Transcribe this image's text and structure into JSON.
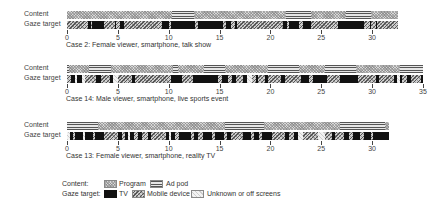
{
  "chart_data": {
    "type": "timeline",
    "title": "",
    "xlabel": "",
    "ylabel": "",
    "xlim": [
      0,
      35
    ],
    "px_per_unit": 10.17,
    "row_labels": {
      "content": "Content",
      "gaze": "Gaze target"
    },
    "cases": [
      {
        "caption": "Case 2: Female viewer, smartphone, talk show",
        "end": 32.5,
        "ticks": [
          0,
          5,
          10,
          15,
          20,
          25,
          30
        ],
        "content": [
          {
            "type": "program",
            "start": 0,
            "end": 10.3
          },
          {
            "type": "ad",
            "start": 10.3,
            "end": 12.5
          },
          {
            "type": "program",
            "start": 12.5,
            "end": 21.5
          },
          {
            "type": "ad",
            "start": 21.5,
            "end": 24.0
          },
          {
            "type": "program",
            "start": 24.0,
            "end": 27.4
          },
          {
            "type": "ad",
            "start": 27.4,
            "end": 29.9
          },
          {
            "type": "program",
            "start": 29.9,
            "end": 32.5
          }
        ],
        "gaze": [
          {
            "type": "mobile",
            "start": 0,
            "end": 2.1
          },
          {
            "type": "tv",
            "start": 2.1,
            "end": 2.4
          },
          {
            "type": "mobile",
            "start": 2.4,
            "end": 2.5
          },
          {
            "type": "tv",
            "start": 2.5,
            "end": 3.6
          },
          {
            "type": "mobile",
            "start": 3.6,
            "end": 4.7
          },
          {
            "type": "tv",
            "start": 4.7,
            "end": 4.8
          },
          {
            "type": "mobile",
            "start": 4.8,
            "end": 5.2
          },
          {
            "type": "tv",
            "start": 5.2,
            "end": 5.6
          },
          {
            "type": "mobile",
            "start": 5.6,
            "end": 9.3
          },
          {
            "type": "tv",
            "start": 9.3,
            "end": 10.0
          },
          {
            "type": "mobile",
            "start": 10.0,
            "end": 10.2
          },
          {
            "type": "tv",
            "start": 10.2,
            "end": 12.6
          },
          {
            "type": "mobile",
            "start": 12.6,
            "end": 12.9
          },
          {
            "type": "tv",
            "start": 12.9,
            "end": 15.3
          },
          {
            "type": "mobile",
            "start": 15.3,
            "end": 15.6
          },
          {
            "type": "tv",
            "start": 15.6,
            "end": 16.1
          },
          {
            "type": "mobile",
            "start": 16.1,
            "end": 16.5
          },
          {
            "type": "tv",
            "start": 16.5,
            "end": 16.7
          },
          {
            "type": "mobile",
            "start": 16.7,
            "end": 21.2
          },
          {
            "type": "tv",
            "start": 21.2,
            "end": 21.6
          },
          {
            "type": "mobile",
            "start": 21.6,
            "end": 21.8
          },
          {
            "type": "tv",
            "start": 21.8,
            "end": 22.8
          },
          {
            "type": "mobile",
            "start": 22.8,
            "end": 23.2
          },
          {
            "type": "tv",
            "start": 23.2,
            "end": 24.0
          },
          {
            "type": "mobile",
            "start": 24.0,
            "end": 26.6
          },
          {
            "type": "tv",
            "start": 26.6,
            "end": 29.2
          },
          {
            "type": "mobile",
            "start": 29.2,
            "end": 29.8
          },
          {
            "type": "tv",
            "start": 29.8,
            "end": 29.9
          },
          {
            "type": "mobile",
            "start": 29.9,
            "end": 30.4
          },
          {
            "type": "tv",
            "start": 30.4,
            "end": 30.5
          },
          {
            "type": "mobile",
            "start": 30.5,
            "end": 32.5
          }
        ]
      },
      {
        "caption": "Case 14: Male viewer, smartphone, live sports event",
        "end": 35,
        "ticks": [
          0,
          5,
          10,
          15,
          20,
          25,
          30,
          35
        ],
        "content": [
          {
            "type": "ad",
            "start": 0,
            "end": 0.2
          },
          {
            "type": "program",
            "start": 0.2,
            "end": 2.2
          },
          {
            "type": "ad",
            "start": 2.2,
            "end": 4.3
          },
          {
            "type": "program",
            "start": 4.3,
            "end": 10.4
          },
          {
            "type": "ad",
            "start": 10.4,
            "end": 10.9
          },
          {
            "type": "program",
            "start": 10.9,
            "end": 13.5
          },
          {
            "type": "ad",
            "start": 13.5,
            "end": 15.5
          },
          {
            "type": "program",
            "start": 15.5,
            "end": 19.8
          },
          {
            "type": "ad",
            "start": 19.8,
            "end": 22.8
          },
          {
            "type": "program",
            "start": 22.8,
            "end": 25.4
          },
          {
            "type": "ad",
            "start": 25.4,
            "end": 28.4
          },
          {
            "type": "program",
            "start": 28.4,
            "end": 32.7
          },
          {
            "type": "ad",
            "start": 32.7,
            "end": 35
          }
        ],
        "gaze": [
          {
            "type": "mobile",
            "start": 0,
            "end": 0.4
          },
          {
            "type": "tv",
            "start": 0.4,
            "end": 0.8
          },
          {
            "type": "unknown",
            "start": 0.8,
            "end": 1.0
          },
          {
            "type": "tv",
            "start": 1.0,
            "end": 1.5
          },
          {
            "type": "unknown",
            "start": 1.5,
            "end": 1.8
          },
          {
            "type": "mobile",
            "start": 1.8,
            "end": 2.9
          },
          {
            "type": "tv",
            "start": 2.9,
            "end": 3.3
          },
          {
            "type": "mobile",
            "start": 3.3,
            "end": 4.2
          },
          {
            "type": "tv",
            "start": 4.2,
            "end": 4.5
          },
          {
            "type": "unknown",
            "start": 4.5,
            "end": 5.0
          },
          {
            "type": "mobile",
            "start": 5.0,
            "end": 6.4
          },
          {
            "type": "tv",
            "start": 6.4,
            "end": 6.7
          },
          {
            "type": "mobile",
            "start": 6.7,
            "end": 10.2
          },
          {
            "type": "tv",
            "start": 10.2,
            "end": 11.3
          },
          {
            "type": "mobile",
            "start": 11.3,
            "end": 12.4
          },
          {
            "type": "tv",
            "start": 12.4,
            "end": 14.8
          },
          {
            "type": "mobile",
            "start": 14.8,
            "end": 15.2
          },
          {
            "type": "tv",
            "start": 15.2,
            "end": 15.8
          },
          {
            "type": "mobile",
            "start": 15.8,
            "end": 16.2
          },
          {
            "type": "tv",
            "start": 16.2,
            "end": 16.6
          },
          {
            "type": "mobile",
            "start": 16.6,
            "end": 17.3
          },
          {
            "type": "tv",
            "start": 17.3,
            "end": 17.7
          },
          {
            "type": "unknown",
            "start": 17.7,
            "end": 18.2
          },
          {
            "type": "mobile",
            "start": 18.2,
            "end": 18.6
          },
          {
            "type": "tv",
            "start": 18.6,
            "end": 18.8
          },
          {
            "type": "mobile",
            "start": 18.8,
            "end": 19.5
          },
          {
            "type": "tv",
            "start": 19.5,
            "end": 19.8
          },
          {
            "type": "mobile",
            "start": 19.8,
            "end": 21.0
          },
          {
            "type": "tv",
            "start": 21.0,
            "end": 21.4
          },
          {
            "type": "mobile",
            "start": 21.4,
            "end": 23.0
          },
          {
            "type": "tv",
            "start": 23.0,
            "end": 23.8
          },
          {
            "type": "mobile",
            "start": 23.8,
            "end": 24.2
          },
          {
            "type": "tv",
            "start": 24.2,
            "end": 25.6
          },
          {
            "type": "mobile",
            "start": 25.6,
            "end": 26.8
          },
          {
            "type": "tv",
            "start": 26.8,
            "end": 28.6
          },
          {
            "type": "mobile",
            "start": 28.6,
            "end": 30.4
          },
          {
            "type": "tv",
            "start": 30.4,
            "end": 30.7
          },
          {
            "type": "mobile",
            "start": 30.7,
            "end": 32.2
          },
          {
            "type": "tv",
            "start": 32.2,
            "end": 32.4
          },
          {
            "type": "unknown",
            "start": 32.4,
            "end": 32.7
          },
          {
            "type": "tv",
            "start": 32.7,
            "end": 32.9
          },
          {
            "type": "mobile",
            "start": 32.9,
            "end": 33.4
          },
          {
            "type": "tv",
            "start": 33.4,
            "end": 33.8
          },
          {
            "type": "mobile",
            "start": 33.8,
            "end": 34.8
          },
          {
            "type": "tv",
            "start": 34.8,
            "end": 35
          }
        ]
      },
      {
        "caption": "Case 13: Female viewer, smartphone, reality TV",
        "end": 31.7,
        "ticks": [
          0,
          5,
          10,
          15,
          20,
          25,
          30
        ],
        "content": [
          {
            "type": "ad",
            "start": 0,
            "end": 3.0
          },
          {
            "type": "program",
            "start": 3.0,
            "end": 15.5
          },
          {
            "type": "ad",
            "start": 15.5,
            "end": 19.4
          },
          {
            "type": "program",
            "start": 19.4,
            "end": 26.8
          },
          {
            "type": "ad",
            "start": 26.8,
            "end": 31.3
          },
          {
            "type": "program",
            "start": 31.3,
            "end": 31.7
          }
        ],
        "gaze": [
          {
            "type": "unknown",
            "start": 0,
            "end": 0.3
          },
          {
            "type": "tv",
            "start": 0.3,
            "end": 0.6
          },
          {
            "type": "mobile",
            "start": 0.6,
            "end": 0.8
          },
          {
            "type": "tv",
            "start": 0.8,
            "end": 1.6
          },
          {
            "type": "unknown",
            "start": 1.6,
            "end": 1.8
          },
          {
            "type": "tv",
            "start": 1.8,
            "end": 2.6
          },
          {
            "type": "mobile",
            "start": 2.6,
            "end": 2.8
          },
          {
            "type": "tv",
            "start": 2.8,
            "end": 3.6
          },
          {
            "type": "mobile",
            "start": 3.6,
            "end": 5.0
          },
          {
            "type": "tv",
            "start": 5.0,
            "end": 5.4
          },
          {
            "type": "mobile",
            "start": 5.4,
            "end": 5.7
          },
          {
            "type": "tv",
            "start": 5.7,
            "end": 6.0
          },
          {
            "type": "unknown",
            "start": 6.0,
            "end": 6.2
          },
          {
            "type": "tv",
            "start": 6.2,
            "end": 6.6
          },
          {
            "type": "mobile",
            "start": 6.6,
            "end": 7.0
          },
          {
            "type": "tv",
            "start": 7.0,
            "end": 7.4
          },
          {
            "type": "mobile",
            "start": 7.4,
            "end": 8.0
          },
          {
            "type": "tv",
            "start": 8.0,
            "end": 8.3
          },
          {
            "type": "mobile",
            "start": 8.3,
            "end": 9.7
          },
          {
            "type": "tv",
            "start": 9.7,
            "end": 10.0
          },
          {
            "type": "unknown",
            "start": 10.0,
            "end": 10.2
          },
          {
            "type": "tv",
            "start": 10.2,
            "end": 10.6
          },
          {
            "type": "mobile",
            "start": 10.6,
            "end": 11.0
          },
          {
            "type": "tv",
            "start": 11.0,
            "end": 12.2
          },
          {
            "type": "mobile",
            "start": 12.2,
            "end": 12.5
          },
          {
            "type": "tv",
            "start": 12.5,
            "end": 12.9
          },
          {
            "type": "mobile",
            "start": 12.9,
            "end": 13.4
          },
          {
            "type": "tv",
            "start": 13.4,
            "end": 14.3
          },
          {
            "type": "mobile",
            "start": 14.3,
            "end": 14.6
          },
          {
            "type": "tv",
            "start": 14.6,
            "end": 15.4
          },
          {
            "type": "mobile",
            "start": 15.4,
            "end": 15.7
          },
          {
            "type": "tv",
            "start": 15.7,
            "end": 16.1
          },
          {
            "type": "mobile",
            "start": 16.1,
            "end": 17.3
          },
          {
            "type": "tv",
            "start": 17.3,
            "end": 18.1
          },
          {
            "type": "mobile",
            "start": 18.1,
            "end": 18.4
          },
          {
            "type": "tv",
            "start": 18.4,
            "end": 18.9
          },
          {
            "type": "mobile",
            "start": 18.9,
            "end": 19.2
          },
          {
            "type": "tv",
            "start": 19.2,
            "end": 20.2
          },
          {
            "type": "mobile",
            "start": 20.2,
            "end": 21.4
          },
          {
            "type": "tv",
            "start": 21.4,
            "end": 21.8
          },
          {
            "type": "mobile",
            "start": 21.8,
            "end": 22.3
          },
          {
            "type": "tv",
            "start": 22.3,
            "end": 22.7
          },
          {
            "type": "unknown",
            "start": 22.7,
            "end": 23.2
          },
          {
            "type": "mobile",
            "start": 23.2,
            "end": 24.7
          },
          {
            "type": "unknown",
            "start": 24.7,
            "end": 25.4
          },
          {
            "type": "mobile",
            "start": 25.4,
            "end": 26.1
          },
          {
            "type": "tv",
            "start": 26.1,
            "end": 26.4
          },
          {
            "type": "mobile",
            "start": 26.4,
            "end": 27.2
          },
          {
            "type": "tv",
            "start": 27.2,
            "end": 27.7
          },
          {
            "type": "mobile",
            "start": 27.7,
            "end": 28.1
          },
          {
            "type": "tv",
            "start": 28.1,
            "end": 28.8
          },
          {
            "type": "mobile",
            "start": 28.8,
            "end": 29.2
          },
          {
            "type": "tv",
            "start": 29.2,
            "end": 29.9
          },
          {
            "type": "mobile",
            "start": 29.9,
            "end": 30.1
          },
          {
            "type": "tv",
            "start": 30.1,
            "end": 31.7
          }
        ]
      }
    ],
    "legend": {
      "content_label": "Content:",
      "gaze_label": "Gaze target:",
      "items": {
        "program": "Program",
        "ad": "Ad pod",
        "tv": "TV",
        "mobile": "Mobile device",
        "unknown": "Unknown or off screens"
      }
    }
  }
}
